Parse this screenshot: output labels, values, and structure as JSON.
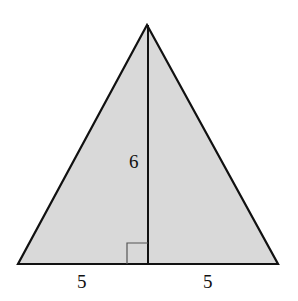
{
  "diagram": {
    "type": "isosceles-triangle-with-altitude",
    "fill_color": "#d9d9d9",
    "stroke_color": "#111111",
    "labels": {
      "height": "6",
      "left_half_base": "5",
      "right_half_base": "5"
    },
    "right_angle_marker": true
  }
}
